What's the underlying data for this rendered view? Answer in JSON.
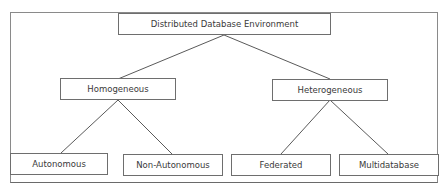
{
  "diagram": {
    "type": "tree",
    "root": {
      "label": "Distributed Database Environment"
    },
    "level1": [
      {
        "label": "Homogeneous"
      },
      {
        "label": "Heterogeneous"
      }
    ],
    "level2": [
      {
        "label": "Autonomous",
        "parent": "Homogeneous"
      },
      {
        "label": "Non-Autonomous",
        "parent": "Homogeneous"
      },
      {
        "label": "Federated",
        "parent": "Heterogeneous"
      },
      {
        "label": "Multidatabase",
        "parent": "Heterogeneous"
      }
    ],
    "colors": {
      "line": "#5a5a5a",
      "border": "#6e6e6e",
      "text": "#3a3a3a",
      "background": "#ffffff"
    }
  }
}
